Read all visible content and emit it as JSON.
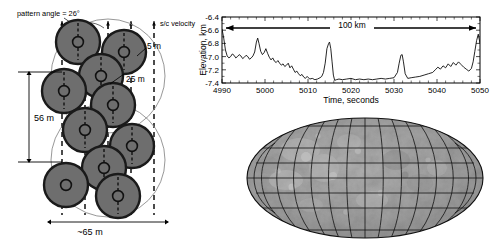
{
  "figure": {
    "panels": [
      "spot-pattern-diagram",
      "elevation-profile-chart",
      "lunar-mollweide-map"
    ]
  },
  "spot_pattern": {
    "pattern_angle_label": "pattern angle = 26°",
    "velocity_label": "s/c velocity",
    "spot_diameter_label": "5 m",
    "spot_spacing_label": "25 m",
    "cross_track_label": "~65 m",
    "along_track_label": "56 m",
    "spot_count_per_frame": 5,
    "frames_shown": 2,
    "arrow_count": 5,
    "dashed_track_count": 5,
    "spot_fill_color": "#6e6e6e",
    "spot_edge_color": "#1a1a1a",
    "envelope_color": "#888888",
    "frames": [
      {
        "name": "frame-upper",
        "center": [
          108,
          76
        ],
        "radius": 57,
        "spots": [
          {
            "id": "spot-1",
            "cx": 78,
            "cy": 42
          },
          {
            "id": "spot-2",
            "cx": 124,
            "cy": 52
          },
          {
            "id": "spot-3",
            "cx": 101,
            "cy": 76
          },
          {
            "id": "spot-4",
            "cx": 64,
            "cy": 91
          },
          {
            "id": "spot-5",
            "cx": 113,
            "cy": 105
          }
        ]
      },
      {
        "name": "frame-lower",
        "center": [
          108,
          160
        ],
        "radius": 57,
        "spots": [
          {
            "id": "spot-6",
            "cx": 85,
            "cy": 130
          },
          {
            "id": "spot-7",
            "cx": 132,
            "cy": 146
          },
          {
            "id": "spot-8",
            "cx": 104,
            "cy": 168
          },
          {
            "id": "spot-9",
            "cx": 66,
            "cy": 185
          },
          {
            "id": "spot-10",
            "cx": 118,
            "cy": 196
          }
        ]
      }
    ]
  },
  "chart_data": {
    "type": "line",
    "title": "",
    "xlabel": "Time, seconds",
    "ylabel": "Elevation, km",
    "xlim": [
      4990,
      5050
    ],
    "ylim": [
      -7.4,
      -6.4
    ],
    "xticks": [
      4990,
      5000,
      5010,
      5020,
      5030,
      5040,
      5050
    ],
    "yticks": [
      -6.4,
      -6.6,
      -6.8,
      -7.0,
      -7.2,
      -7.4
    ],
    "xtick_labels": [
      "4990",
      "5000",
      "5010",
      "5020",
      "5030",
      "5040",
      "5050"
    ],
    "ytick_labels": [
      "-6.4",
      "-6.6",
      "-6.8",
      "-7.0",
      "-7.2",
      "-7.4"
    ],
    "grid": false,
    "legend": null,
    "annotations": [
      {
        "text": "100 km",
        "type": "double-arrow",
        "x_start": 4990,
        "x_end": 5049,
        "y": -6.58
      }
    ],
    "series": [
      {
        "name": "Elevation profile",
        "color": "#000000",
        "x": [
          4990.0,
          4990.4,
          4990.8,
          4991.2,
          4991.6,
          4992.0,
          4992.4,
          4992.8,
          4993.2,
          4993.6,
          4994.0,
          4994.4,
          4994.8,
          4995.2,
          4995.6,
          4996.0,
          4996.4,
          4996.8,
          4997.2,
          4997.6,
          4998.0,
          4998.3,
          4998.6,
          4999.0,
          4999.4,
          4999.8,
          5000.2,
          5000.6,
          5001.0,
          5001.4,
          5001.8,
          5002.2,
          5002.6,
          5003.0,
          5003.4,
          5003.8,
          5004.2,
          5004.6,
          5005.0,
          5005.4,
          5005.8,
          5006.2,
          5006.6,
          5007.0,
          5007.4,
          5007.8,
          5008.2,
          5008.6,
          5009.0,
          5009.4,
          5009.8,
          5010.4,
          5011.0,
          5011.6,
          5012.2,
          5012.8,
          5013.2,
          5013.6,
          5014.0,
          5014.4,
          5014.8,
          5015.0,
          5015.3,
          5015.6,
          5015.9,
          5016.2,
          5016.6,
          5017.2,
          5018.0,
          5019.0,
          5020.0,
          5021.0,
          5022.0,
          5023.0,
          5024.0,
          5025.0,
          5026.0,
          5027.0,
          5028.0,
          5029.0,
          5030.0,
          5030.8,
          5031.2,
          5031.6,
          5031.9,
          5032.2,
          5032.6,
          5033.2,
          5034.0,
          5035.0,
          5036.0,
          5037.0,
          5038.0,
          5039.0,
          5039.6,
          5040.2,
          5040.8,
          5041.4,
          5042.0,
          5042.6,
          5043.2,
          5043.8,
          5044.4,
          5045.0,
          5045.6,
          5046.2,
          5046.8,
          5047.4,
          5048.0,
          5048.4,
          5048.8,
          5049.2,
          5049.6,
          5050.0
        ],
        "y": [
          -6.58,
          -6.72,
          -6.9,
          -6.99,
          -7.02,
          -7.0,
          -6.96,
          -6.98,
          -7.02,
          -7.0,
          -6.97,
          -6.99,
          -7.03,
          -7.01,
          -6.98,
          -7.0,
          -7.04,
          -7.02,
          -6.99,
          -6.93,
          -6.78,
          -6.72,
          -6.8,
          -6.92,
          -6.97,
          -6.94,
          -6.88,
          -6.95,
          -7.01,
          -7.05,
          -7.02,
          -7.07,
          -7.09,
          -7.06,
          -7.1,
          -7.13,
          -7.11,
          -7.15,
          -7.13,
          -7.1,
          -7.17,
          -7.14,
          -7.19,
          -7.24,
          -7.22,
          -7.26,
          -7.29,
          -7.27,
          -7.31,
          -7.33,
          -7.3,
          -7.34,
          -7.33,
          -7.35,
          -7.34,
          -7.32,
          -7.3,
          -7.24,
          -7.1,
          -6.88,
          -6.8,
          -6.78,
          -6.88,
          -7.08,
          -7.28,
          -7.36,
          -7.35,
          -7.34,
          -7.35,
          -7.34,
          -7.33,
          -7.35,
          -7.34,
          -7.35,
          -7.34,
          -7.35,
          -7.34,
          -7.33,
          -7.34,
          -7.33,
          -7.32,
          -7.24,
          -7.1,
          -6.98,
          -6.97,
          -7.08,
          -7.26,
          -7.33,
          -7.32,
          -7.31,
          -7.3,
          -7.28,
          -7.26,
          -7.24,
          -7.2,
          -7.16,
          -7.19,
          -7.14,
          -7.17,
          -7.11,
          -7.15,
          -7.09,
          -7.13,
          -7.08,
          -7.12,
          -7.16,
          -7.19,
          -7.22,
          -7.18,
          -7.08,
          -6.92,
          -6.76,
          -6.66,
          -6.8
        ]
      }
    ]
  },
  "map": {
    "name": "lunar-mollweide-map",
    "projection": "Mollweide",
    "body": "Moon",
    "graticule_meridian_step_deg": 20,
    "graticule_parallel_step_deg": 30,
    "base_color": "#9a9a9a",
    "graticule_color": "#111111"
  }
}
